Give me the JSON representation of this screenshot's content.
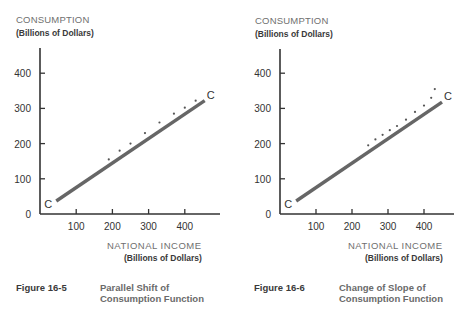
{
  "chart_data": [
    {
      "type": "line",
      "figure_number": "Figure 16-5",
      "caption": [
        "Parallel Shift of",
        "Consumption Function"
      ],
      "ylabel": "CONSUMPTION",
      "ylabel_units": "(Billions of Dollars)",
      "xlabel": "NATIONAL INCOME",
      "xlabel_units": "(Billions of Dollars)",
      "xlim": [
        0,
        480
      ],
      "ylim": [
        0,
        480
      ],
      "xticks": [
        100,
        200,
        300,
        400
      ],
      "yticks": [
        0,
        100,
        200,
        300,
        400
      ],
      "grid": false,
      "series": [
        {
          "name": "C",
          "style": "solid",
          "label": "C",
          "x": [
            45,
            455
          ],
          "y": [
            37,
            322
          ]
        },
        {
          "name": "Shifted consumption function",
          "style": "dotted",
          "x": [
            190,
            220,
            250,
            290,
            330,
            370,
            400,
            430
          ],
          "y": [
            155,
            180,
            200,
            230,
            260,
            285,
            302,
            322
          ]
        }
      ]
    },
    {
      "type": "line",
      "figure_number": "Figure 16-6",
      "caption": [
        "Change of Slope of",
        "Consumption Function"
      ],
      "ylabel": "CONSUMPTION",
      "ylabel_units": "(Billions of Dollars)",
      "xlabel": "NATIONAL INCOME",
      "xlabel_units": "(Billions of Dollars)",
      "xlim": [
        0,
        480
      ],
      "ylim": [
        0,
        480
      ],
      "xticks": [
        100,
        200,
        300,
        400
      ],
      "yticks": [
        0,
        100,
        200,
        300,
        400
      ],
      "grid": false,
      "series": [
        {
          "name": "C",
          "style": "solid",
          "label": "C",
          "x": [
            45,
            450
          ],
          "y": [
            37,
            318
          ]
        },
        {
          "name": "Steeper consumption function",
          "style": "dotted",
          "x": [
            245,
            265,
            285,
            305,
            325,
            350,
            375,
            400,
            420,
            430
          ],
          "y": [
            195,
            212,
            225,
            238,
            250,
            268,
            290,
            308,
            330,
            355
          ]
        }
      ]
    }
  ]
}
